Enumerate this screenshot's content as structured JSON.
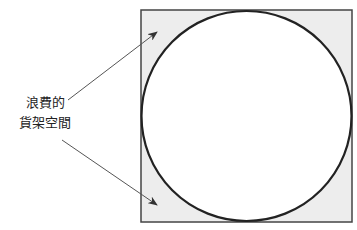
{
  "label": {
    "line1": "浪費的",
    "line2": "貨架空間"
  },
  "colors": {
    "square_fill": "#ededed",
    "stroke": "#222222",
    "arrow": "#555555"
  }
}
